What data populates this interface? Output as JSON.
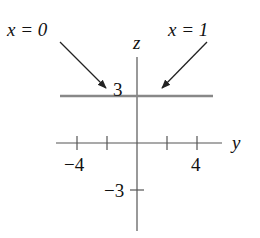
{
  "labels": {
    "x0": "x = 0",
    "x1": "x = 1",
    "z_axis": "z",
    "y_axis": "y",
    "tick_z_pos": "3",
    "tick_z_neg": "−3",
    "tick_y_neg": "−4",
    "tick_y_pos": "4"
  },
  "colors": {
    "axis": "#555555",
    "plot_line": "#888888",
    "arrow": "#222222",
    "text": "#111111"
  },
  "diagram": {
    "type": "coordinate-plane-yz",
    "horizontal_axis": "y",
    "vertical_axis": "z",
    "y_ticks": [
      -4,
      -2,
      2,
      4
    ],
    "z_ticks": [
      3,
      -3
    ],
    "line": {
      "equation": "z = 3",
      "note": "trace for both x = 0 and x = 1"
    },
    "arrows": [
      {
        "label": "x = 0",
        "points_to": "line z = 3 (left)"
      },
      {
        "label": "x = 1",
        "points_to": "line z = 3 (right)"
      }
    ]
  }
}
